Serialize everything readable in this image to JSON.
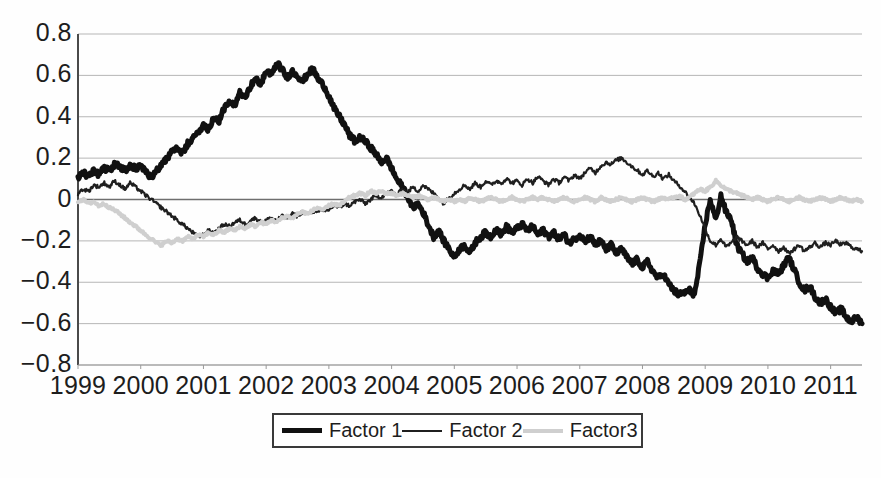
{
  "chart_data": {
    "type": "line",
    "title": "",
    "xlabel": "",
    "ylabel": "",
    "grid": true,
    "legend_position": "bottom-center",
    "ylim": [
      -0.8,
      0.8
    ],
    "xlim": [
      1999.0,
      2011.5
    ],
    "yticks": [
      "0.8",
      "0.6",
      "0.4",
      "0.2",
      "0",
      "−0.2",
      "−0.4",
      "−0.6",
      "−0.8"
    ],
    "ytick_values": [
      0.8,
      0.6,
      0.4,
      0.2,
      0,
      -0.2,
      -0.4,
      -0.6,
      -0.8
    ],
    "xticks": [
      "1999",
      "2000",
      "2001",
      "2002",
      "2003",
      "2004",
      "2005",
      "2006",
      "2007",
      "2008",
      "2009",
      "2010",
      "2011"
    ],
    "xtick_values": [
      1999,
      2000,
      2001,
      2002,
      2003,
      2004,
      2005,
      2006,
      2007,
      2008,
      2009,
      2010,
      2011
    ],
    "series": [
      {
        "name": "Factor 1",
        "color": "#111111",
        "width": 5,
        "x": [
          1999.0,
          1999.08,
          1999.17,
          1999.25,
          1999.33,
          1999.42,
          1999.5,
          1999.58,
          1999.67,
          1999.75,
          1999.83,
          1999.92,
          2000.0,
          2000.08,
          2000.17,
          2000.25,
          2000.33,
          2000.42,
          2000.5,
          2000.58,
          2000.67,
          2000.75,
          2000.83,
          2000.92,
          2001.0,
          2001.08,
          2001.17,
          2001.25,
          2001.33,
          2001.42,
          2001.5,
          2001.58,
          2001.67,
          2001.75,
          2001.83,
          2001.92,
          2002.0,
          2002.08,
          2002.17,
          2002.25,
          2002.33,
          2002.42,
          2002.5,
          2002.58,
          2002.67,
          2002.75,
          2002.83,
          2002.92,
          2003.0,
          2003.08,
          2003.17,
          2003.25,
          2003.33,
          2003.42,
          2003.5,
          2003.58,
          2003.67,
          2003.75,
          2003.83,
          2003.92,
          2004.0,
          2004.08,
          2004.17,
          2004.25,
          2004.33,
          2004.42,
          2004.5,
          2004.58,
          2004.67,
          2004.75,
          2004.83,
          2004.92,
          2005.0,
          2005.08,
          2005.17,
          2005.25,
          2005.33,
          2005.42,
          2005.5,
          2005.58,
          2005.67,
          2005.75,
          2005.83,
          2005.92,
          2006.0,
          2006.08,
          2006.17,
          2006.25,
          2006.33,
          2006.42,
          2006.5,
          2006.58,
          2006.67,
          2006.75,
          2006.83,
          2006.92,
          2007.0,
          2007.08,
          2007.17,
          2007.25,
          2007.33,
          2007.42,
          2007.5,
          2007.58,
          2007.67,
          2007.75,
          2007.83,
          2007.92,
          2008.0,
          2008.08,
          2008.17,
          2008.25,
          2008.33,
          2008.42,
          2008.5,
          2008.58,
          2008.67,
          2008.75,
          2008.83,
          2008.92,
          2009.0,
          2009.08,
          2009.17,
          2009.25,
          2009.33,
          2009.42,
          2009.5,
          2009.58,
          2009.67,
          2009.75,
          2009.83,
          2009.92,
          2010.0,
          2010.08,
          2010.17,
          2010.25,
          2010.33,
          2010.42,
          2010.5,
          2010.58,
          2010.67,
          2010.75,
          2010.83,
          2010.92,
          2011.0,
          2011.08,
          2011.17,
          2011.25,
          2011.33,
          2011.42,
          2011.5
        ],
        "y": [
          0.1,
          0.13,
          0.11,
          0.14,
          0.12,
          0.15,
          0.14,
          0.17,
          0.16,
          0.14,
          0.17,
          0.15,
          0.16,
          0.13,
          0.11,
          0.14,
          0.17,
          0.2,
          0.23,
          0.25,
          0.22,
          0.27,
          0.29,
          0.33,
          0.36,
          0.34,
          0.4,
          0.38,
          0.44,
          0.47,
          0.45,
          0.52,
          0.5,
          0.55,
          0.58,
          0.56,
          0.62,
          0.6,
          0.66,
          0.63,
          0.59,
          0.62,
          0.6,
          0.57,
          0.61,
          0.63,
          0.58,
          0.55,
          0.5,
          0.44,
          0.4,
          0.36,
          0.31,
          0.28,
          0.3,
          0.28,
          0.25,
          0.22,
          0.18,
          0.2,
          0.15,
          0.1,
          0.06,
          0.02,
          -0.04,
          -0.02,
          -0.06,
          -0.12,
          -0.18,
          -0.15,
          -0.2,
          -0.24,
          -0.28,
          -0.24,
          -0.22,
          -0.26,
          -0.21,
          -0.18,
          -0.16,
          -0.18,
          -0.14,
          -0.17,
          -0.13,
          -0.16,
          -0.14,
          -0.12,
          -0.15,
          -0.13,
          -0.17,
          -0.15,
          -0.18,
          -0.16,
          -0.19,
          -0.17,
          -0.21,
          -0.19,
          -0.17,
          -0.2,
          -0.18,
          -0.22,
          -0.2,
          -0.24,
          -0.22,
          -0.26,
          -0.24,
          -0.28,
          -0.31,
          -0.29,
          -0.33,
          -0.3,
          -0.35,
          -0.38,
          -0.36,
          -0.41,
          -0.44,
          -0.46,
          -0.45,
          -0.44,
          -0.46,
          -0.3,
          -0.12,
          0.0,
          -0.1,
          0.02,
          -0.06,
          -0.1,
          -0.22,
          -0.26,
          -0.3,
          -0.28,
          -0.33,
          -0.36,
          -0.38,
          -0.34,
          -0.36,
          -0.32,
          -0.28,
          -0.34,
          -0.4,
          -0.44,
          -0.42,
          -0.47,
          -0.5,
          -0.48,
          -0.52,
          -0.55,
          -0.53,
          -0.57,
          -0.59,
          -0.57,
          -0.6
        ]
      },
      {
        "name": "Factor 2",
        "color": "#1f1f1f",
        "width": 2.2,
        "x": [
          1999.0,
          1999.08,
          1999.17,
          1999.25,
          1999.33,
          1999.42,
          1999.5,
          1999.58,
          1999.67,
          1999.75,
          1999.83,
          1999.92,
          2000.0,
          2000.08,
          2000.17,
          2000.25,
          2000.33,
          2000.42,
          2000.5,
          2000.58,
          2000.67,
          2000.75,
          2000.83,
          2000.92,
          2001.0,
          2001.08,
          2001.17,
          2001.25,
          2001.33,
          2001.42,
          2001.5,
          2001.58,
          2001.67,
          2001.75,
          2001.83,
          2001.92,
          2002.0,
          2002.08,
          2002.17,
          2002.25,
          2002.33,
          2002.42,
          2002.5,
          2002.58,
          2002.67,
          2002.75,
          2002.83,
          2002.92,
          2003.0,
          2003.08,
          2003.17,
          2003.25,
          2003.33,
          2003.42,
          2003.5,
          2003.58,
          2003.67,
          2003.75,
          2003.83,
          2003.92,
          2004.0,
          2004.08,
          2004.17,
          2004.25,
          2004.33,
          2004.42,
          2004.5,
          2004.58,
          2004.67,
          2004.75,
          2004.83,
          2004.92,
          2005.0,
          2005.08,
          2005.17,
          2005.25,
          2005.33,
          2005.42,
          2005.5,
          2005.58,
          2005.67,
          2005.75,
          2005.83,
          2005.92,
          2006.0,
          2006.08,
          2006.17,
          2006.25,
          2006.33,
          2006.42,
          2006.5,
          2006.58,
          2006.67,
          2006.75,
          2006.83,
          2006.92,
          2007.0,
          2007.08,
          2007.17,
          2007.25,
          2007.33,
          2007.42,
          2007.5,
          2007.58,
          2007.67,
          2007.75,
          2007.83,
          2007.92,
          2008.0,
          2008.08,
          2008.17,
          2008.25,
          2008.33,
          2008.42,
          2008.5,
          2008.58,
          2008.67,
          2008.75,
          2008.83,
          2008.92,
          2009.0,
          2009.08,
          2009.17,
          2009.25,
          2009.33,
          2009.42,
          2009.5,
          2009.58,
          2009.67,
          2009.75,
          2009.83,
          2009.92,
          2010.0,
          2010.08,
          2010.17,
          2010.25,
          2010.33,
          2010.42,
          2010.5,
          2010.58,
          2010.67,
          2010.75,
          2010.83,
          2010.92,
          2011.0,
          2011.08,
          2011.17,
          2011.25,
          2011.33,
          2011.42,
          2011.5
        ],
        "y": [
          0.03,
          0.05,
          0.04,
          0.07,
          0.06,
          0.08,
          0.06,
          0.09,
          0.07,
          0.05,
          0.08,
          0.06,
          0.04,
          0.02,
          0.0,
          -0.02,
          -0.04,
          -0.06,
          -0.08,
          -0.1,
          -0.12,
          -0.14,
          -0.16,
          -0.18,
          -0.17,
          -0.15,
          -0.16,
          -0.14,
          -0.12,
          -0.13,
          -0.11,
          -0.1,
          -0.12,
          -0.1,
          -0.09,
          -0.11,
          -0.1,
          -0.09,
          -0.1,
          -0.08,
          -0.09,
          -0.07,
          -0.08,
          -0.06,
          -0.07,
          -0.06,
          -0.05,
          -0.06,
          -0.05,
          -0.03,
          -0.04,
          -0.02,
          -0.03,
          -0.01,
          0.0,
          -0.02,
          0.0,
          0.02,
          0.01,
          0.03,
          0.04,
          0.02,
          0.05,
          0.03,
          0.06,
          0.04,
          0.07,
          0.05,
          0.03,
          0.01,
          -0.02,
          0.01,
          0.03,
          0.05,
          0.07,
          0.05,
          0.08,
          0.06,
          0.09,
          0.07,
          0.09,
          0.08,
          0.1,
          0.08,
          0.09,
          0.07,
          0.1,
          0.08,
          0.11,
          0.09,
          0.07,
          0.1,
          0.08,
          0.11,
          0.09,
          0.12,
          0.1,
          0.13,
          0.15,
          0.13,
          0.16,
          0.18,
          0.17,
          0.19,
          0.2,
          0.18,
          0.16,
          0.14,
          0.12,
          0.14,
          0.11,
          0.13,
          0.1,
          0.12,
          0.09,
          0.07,
          0.04,
          0.01,
          -0.02,
          -0.08,
          -0.14,
          -0.2,
          -0.22,
          -0.19,
          -0.23,
          -0.21,
          -0.18,
          -0.2,
          -0.22,
          -0.2,
          -0.23,
          -0.21,
          -0.24,
          -0.22,
          -0.25,
          -0.23,
          -0.26,
          -0.24,
          -0.22,
          -0.25,
          -0.23,
          -0.21,
          -0.23,
          -0.21,
          -0.22,
          -0.2,
          -0.22,
          -0.21,
          -0.23,
          -0.24,
          -0.25
        ]
      },
      {
        "name": "Factor3",
        "color": "#cfcfcf",
        "width": 4,
        "x": [
          1999.0,
          1999.08,
          1999.17,
          1999.25,
          1999.33,
          1999.42,
          1999.5,
          1999.58,
          1999.67,
          1999.75,
          1999.83,
          1999.92,
          2000.0,
          2000.08,
          2000.17,
          2000.25,
          2000.33,
          2000.42,
          2000.5,
          2000.58,
          2000.67,
          2000.75,
          2000.83,
          2000.92,
          2001.0,
          2001.08,
          2001.17,
          2001.25,
          2001.33,
          2001.42,
          2001.5,
          2001.58,
          2001.67,
          2001.75,
          2001.83,
          2001.92,
          2002.0,
          2002.08,
          2002.17,
          2002.25,
          2002.33,
          2002.42,
          2002.5,
          2002.58,
          2002.67,
          2002.75,
          2002.83,
          2002.92,
          2003.0,
          2003.08,
          2003.17,
          2003.25,
          2003.33,
          2003.42,
          2003.5,
          2003.58,
          2003.67,
          2003.75,
          2003.83,
          2003.92,
          2004.0,
          2004.08,
          2004.17,
          2004.25,
          2004.33,
          2004.42,
          2004.5,
          2004.58,
          2004.67,
          2004.75,
          2004.83,
          2004.92,
          2005.0,
          2005.08,
          2005.17,
          2005.25,
          2005.33,
          2005.42,
          2005.5,
          2005.58,
          2005.67,
          2005.75,
          2005.83,
          2005.92,
          2006.0,
          2006.08,
          2006.17,
          2006.25,
          2006.33,
          2006.42,
          2006.5,
          2006.58,
          2006.67,
          2006.75,
          2006.83,
          2006.92,
          2007.0,
          2007.08,
          2007.17,
          2007.25,
          2007.33,
          2007.42,
          2007.5,
          2007.58,
          2007.67,
          2007.75,
          2007.83,
          2007.92,
          2008.0,
          2008.08,
          2008.17,
          2008.25,
          2008.33,
          2008.42,
          2008.5,
          2008.58,
          2008.67,
          2008.75,
          2008.83,
          2008.92,
          2009.0,
          2009.08,
          2009.17,
          2009.25,
          2009.33,
          2009.42,
          2009.5,
          2009.58,
          2009.67,
          2009.75,
          2009.83,
          2009.92,
          2010.0,
          2010.08,
          2010.17,
          2010.25,
          2010.33,
          2010.42,
          2010.5,
          2010.58,
          2010.67,
          2010.75,
          2010.83,
          2010.92,
          2011.0,
          2011.08,
          2011.17,
          2011.25,
          2011.33,
          2011.42,
          2011.5
        ],
        "y": [
          -0.01,
          0.0,
          -0.02,
          -0.01,
          -0.03,
          -0.02,
          -0.04,
          -0.05,
          -0.07,
          -0.09,
          -0.11,
          -0.13,
          -0.15,
          -0.17,
          -0.19,
          -0.21,
          -0.22,
          -0.2,
          -0.21,
          -0.19,
          -0.2,
          -0.18,
          -0.19,
          -0.17,
          -0.18,
          -0.16,
          -0.17,
          -0.15,
          -0.16,
          -0.14,
          -0.15,
          -0.13,
          -0.14,
          -0.12,
          -0.13,
          -0.11,
          -0.12,
          -0.1,
          -0.11,
          -0.09,
          -0.08,
          -0.09,
          -0.07,
          -0.06,
          -0.07,
          -0.05,
          -0.04,
          -0.05,
          -0.03,
          -0.02,
          -0.03,
          -0.01,
          0.01,
          0.02,
          0.03,
          0.02,
          0.04,
          0.03,
          0.04,
          0.03,
          0.03,
          0.02,
          0.03,
          0.02,
          0.01,
          0.02,
          0.01,
          0.0,
          0.01,
          0.0,
          -0.01,
          0.0,
          -0.01,
          0.0,
          -0.01,
          0.01,
          0.0,
          -0.01,
          0.0,
          0.01,
          0.0,
          -0.01,
          0.0,
          0.01,
          0.0,
          -0.01,
          0.0,
          0.01,
          0.0,
          0.01,
          0.0,
          -0.01,
          0.0,
          0.01,
          0.0,
          -0.01,
          0.0,
          0.01,
          0.0,
          -0.01,
          0.01,
          0.0,
          -0.01,
          0.0,
          0.01,
          0.0,
          -0.01,
          0.0,
          0.01,
          0.0,
          -0.01,
          0.0,
          0.01,
          0.0,
          0.01,
          0.02,
          0.0,
          0.01,
          0.03,
          0.05,
          0.04,
          0.06,
          0.09,
          0.07,
          0.05,
          0.04,
          0.03,
          0.02,
          0.01,
          0.0,
          0.01,
          0.0,
          -0.01,
          0.0,
          0.01,
          0.0,
          -0.01,
          0.0,
          0.01,
          0.0,
          -0.01,
          0.0,
          0.01,
          0.0,
          -0.01,
          0.0,
          0.01,
          0.0,
          -0.01,
          0.0,
          -0.01
        ]
      }
    ]
  },
  "legend": {
    "entries": [
      {
        "label": "Factor 1"
      },
      {
        "label": "Factor 2"
      },
      {
        "label": "Factor3"
      }
    ]
  }
}
